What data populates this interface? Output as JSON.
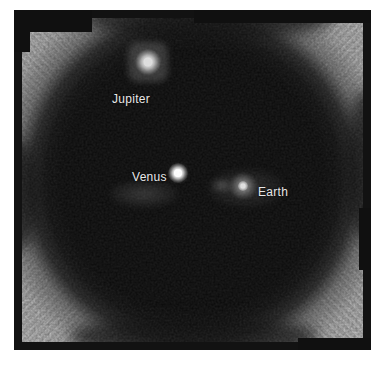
{
  "page": {
    "background_color": "#ffffff"
  },
  "photo": {
    "colors": {
      "frame": "#121212",
      "dark_field": "#0a0a0a",
      "corner_texture": "#8d8d8d",
      "label_text": "#e8e8e8",
      "planet_dot": "#ffffff"
    },
    "annotations": [
      {
        "id": "jupiter",
        "label": "Jupiter"
      },
      {
        "id": "venus",
        "label": "Venus"
      },
      {
        "id": "earth",
        "label": "Earth"
      }
    ]
  }
}
